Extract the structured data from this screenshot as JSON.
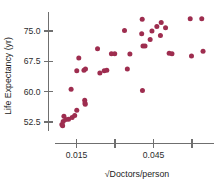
{
  "chart_data": {
    "type": "scatter",
    "title": "",
    "xlabel": "√Doctors/person",
    "ylabel": "Life Expectancy (yr)",
    "xlim": [
      0.0055,
      0.0735
    ],
    "ylim": [
      49.0,
      79.5
    ],
    "xticks": [
      0.015,
      0.03,
      0.045,
      0.06
    ],
    "xticklabels": [
      "0.015",
      "",
      "0.045",
      ""
    ],
    "yticks": [
      52.5,
      60.0,
      67.5,
      75.0
    ],
    "yticklabels": [
      "52.5",
      "60.0",
      "67.5",
      "75.0"
    ],
    "grid": false,
    "legend": null,
    "marker_color": "#9e2d4f",
    "axis_color": "#6f6f6f",
    "series": [
      {
        "name": "Countries",
        "points": [
          [
            0.0093,
            51.9
          ],
          [
            0.0096,
            51.6
          ],
          [
            0.0098,
            52.6
          ],
          [
            0.0101,
            53.9
          ],
          [
            0.0108,
            53.1
          ],
          [
            0.0119,
            53.2
          ],
          [
            0.0133,
            53.6
          ],
          [
            0.0143,
            54.1
          ],
          [
            0.0151,
            55.4
          ],
          [
            0.0129,
            60.6
          ],
          [
            0.0159,
            68.3
          ],
          [
            0.0151,
            65.2
          ],
          [
            0.0179,
            65.3
          ],
          [
            0.0185,
            65.6
          ],
          [
            0.0182,
            57.9
          ],
          [
            0.0183,
            57.2
          ],
          [
            0.0184,
            56.9
          ],
          [
            0.0232,
            70.6
          ],
          [
            0.0241,
            64.6
          ],
          [
            0.0258,
            65.2
          ],
          [
            0.0268,
            65.3
          ],
          [
            0.0286,
            69.4
          ],
          [
            0.0299,
            69.4
          ],
          [
            0.0337,
            75.1
          ],
          [
            0.0348,
            65.6
          ],
          [
            0.0358,
            69.3
          ],
          [
            0.0406,
            77.9
          ],
          [
            0.0404,
            74.3
          ],
          [
            0.0409,
            71.3
          ],
          [
            0.0417,
            71.3
          ],
          [
            0.0407,
            60.3
          ],
          [
            0.0437,
            72.9
          ],
          [
            0.0444,
            75.0
          ],
          [
            0.0463,
            76.1
          ],
          [
            0.0477,
            73.9
          ],
          [
            0.048,
            77.1
          ],
          [
            0.0497,
            75.8
          ],
          [
            0.0511,
            69.5
          ],
          [
            0.0522,
            69.4
          ],
          [
            0.0593,
            78.0
          ],
          [
            0.0598,
            68.8
          ],
          [
            0.0638,
            78.0
          ],
          [
            0.0643,
            70.0
          ]
        ]
      }
    ]
  }
}
